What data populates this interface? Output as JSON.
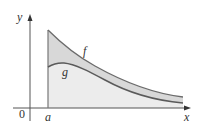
{
  "figure": {
    "labels": {
      "y_axis": "y",
      "x_axis": "x",
      "origin": "0",
      "a_tick": "a",
      "curve_f": "f",
      "curve_g": "g"
    },
    "colors": {
      "axis": "#555555",
      "curve": "#6b6b6b",
      "fill_between": "#d8d8d8",
      "fill_below_g": "#ececec",
      "text": "#333333"
    },
    "curves": {
      "f": {
        "start": [
          48,
          30
        ],
        "end": [
          183,
          97
        ],
        "shape": "decreasing, concave up"
      },
      "g": {
        "start": [
          48,
          67
        ],
        "peak": [
          62,
          63
        ],
        "end": [
          183,
          103
        ],
        "shape": "slight rise then decreasing"
      }
    },
    "shading": {
      "between_f_and_g": true,
      "below_g_to_x_axis": true,
      "left_boundary": "x = a"
    }
  }
}
